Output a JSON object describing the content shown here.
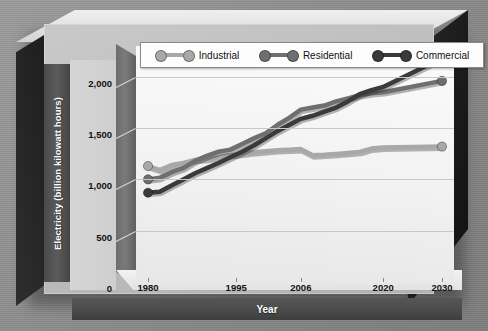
{
  "chart_data": {
    "type": "line",
    "title": "",
    "xlabel": "Year",
    "ylabel": "Electricity (billion kilowatt hours)",
    "xlim": [
      1980,
      2030
    ],
    "ylim": [
      0,
      2300
    ],
    "grid": true,
    "legend_position": "top",
    "y_ticks": [
      "0",
      "500",
      "1,000",
      "1,500",
      "2,000"
    ],
    "y_tick_values": [
      0,
      500,
      1000,
      1500,
      2000
    ],
    "x_ticks": [
      "1980",
      "1995",
      "2006",
      "2020",
      "2030"
    ],
    "x_tick_values": [
      1980,
      1995,
      2006,
      2020,
      2030
    ],
    "series": [
      {
        "name": "Industrial",
        "color": "#a8a8a8",
        "x": [
          1980,
          1982,
          1984,
          1986,
          1988,
          1990,
          1992,
          1994,
          1996,
          1998,
          2000,
          2002,
          2004,
          2006,
          2008,
          2010,
          2012,
          2014,
          2016,
          2018,
          2020,
          2030
        ],
        "values": [
          1130,
          1090,
          1140,
          1160,
          1190,
          1200,
          1215,
          1235,
          1250,
          1265,
          1275,
          1285,
          1290,
          1295,
          1235,
          1240,
          1248,
          1258,
          1268,
          1300,
          1310,
          1320
        ]
      },
      {
        "name": "Residential",
        "color": "#6f6f6f",
        "x": [
          1980,
          1982,
          1984,
          1986,
          1988,
          1990,
          1992,
          1994,
          1996,
          1998,
          2000,
          2002,
          2004,
          2006,
          2008,
          2010,
          2012,
          2014,
          2016,
          2018,
          2020,
          2030
        ],
        "values": [
          1000,
          1015,
          1070,
          1110,
          1180,
          1230,
          1270,
          1290,
          1345,
          1400,
          1450,
          1530,
          1600,
          1680,
          1700,
          1720,
          1760,
          1790,
          1820,
          1840,
          1850,
          1960
        ]
      },
      {
        "name": "Commercial",
        "color": "#3a3a3a",
        "x": [
          1980,
          1982,
          1984,
          1986,
          1988,
          1990,
          1992,
          1994,
          1996,
          1998,
          2000,
          2002,
          2004,
          2006,
          2008,
          2010,
          2012,
          2014,
          2016,
          2018,
          2020,
          2030
        ],
        "values": [
          870,
          880,
          940,
          1000,
          1060,
          1110,
          1160,
          1215,
          1270,
          1330,
          1400,
          1470,
          1530,
          1590,
          1620,
          1660,
          1700,
          1760,
          1830,
          1870,
          1900,
          2180
        ]
      }
    ]
  },
  "legend": {
    "items": [
      {
        "label": "Industrial",
        "color": "#a8a8a8"
      },
      {
        "label": "Residential",
        "color": "#6f6f6f"
      },
      {
        "label": "Commercial",
        "color": "#3a3a3a"
      }
    ]
  },
  "axes": {
    "y_title": "Electricity (billion kilowatt hours)",
    "x_title": "Year"
  }
}
